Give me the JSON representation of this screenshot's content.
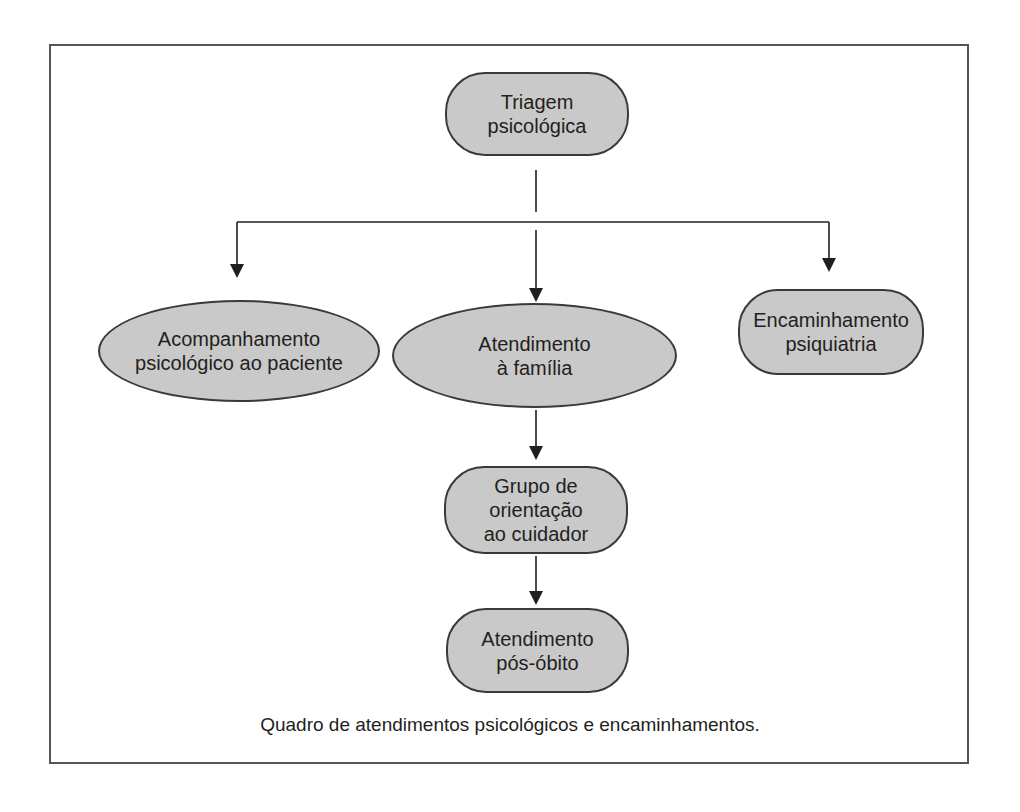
{
  "diagram": {
    "caption": "Quadro de atendimentos psicológicos e encaminhamentos.",
    "colors": {
      "node_fill": "#c9c9c9",
      "node_border": "#3a3a3a",
      "line": "#231f20",
      "frame": "#555555"
    },
    "nodes": {
      "triagem": {
        "shape": "rounded-rectangle",
        "lines": [
          "Triagem",
          "psicológica"
        ]
      },
      "acompanhamento": {
        "shape": "ellipse",
        "lines": [
          "Acompanhamento",
          "psicológico ao paciente"
        ]
      },
      "atendimento_familia": {
        "shape": "ellipse",
        "lines": [
          "Atendimento",
          "à família"
        ]
      },
      "encaminhamento": {
        "shape": "rounded-rectangle",
        "lines": [
          "Encaminhamento",
          "psiquiatria"
        ]
      },
      "grupo": {
        "shape": "rounded-rectangle",
        "lines": [
          "Grupo de",
          "orientação",
          "ao cuidador"
        ]
      },
      "pos_obito": {
        "shape": "rounded-rectangle",
        "lines": [
          "Atendimento",
          "pós-óbito"
        ]
      }
    },
    "edges": [
      {
        "from": "triagem",
        "to": "acompanhamento"
      },
      {
        "from": "triagem",
        "to": "atendimento_familia"
      },
      {
        "from": "triagem",
        "to": "encaminhamento"
      },
      {
        "from": "atendimento_familia",
        "to": "grupo"
      },
      {
        "from": "grupo",
        "to": "pos_obito"
      }
    ]
  }
}
